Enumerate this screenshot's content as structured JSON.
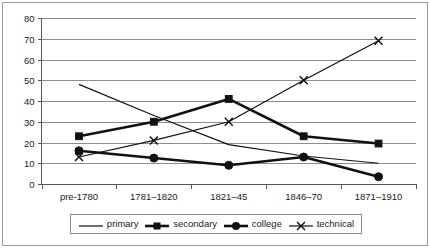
{
  "chart_data": {
    "type": "line",
    "title": "",
    "xlabel": "",
    "ylabel": "",
    "ylim": [
      0,
      80
    ],
    "ytick_step": 10,
    "yticks": [
      "0",
      "10",
      "20",
      "30",
      "40",
      "50",
      "60",
      "70",
      "80"
    ],
    "grid": true,
    "legend_position": "bottom",
    "categories": [
      "pre-1780",
      "1781–1820",
      "1821–45",
      "1846–70",
      "1871–1910"
    ],
    "series": [
      {
        "name": "primary",
        "marker": "none",
        "line": "thin",
        "values": [
          48,
          33,
          19,
          13.5,
          10
        ]
      },
      {
        "name": "secondary",
        "marker": "square",
        "line": "thick",
        "values": [
          23,
          30,
          41,
          23,
          19.5
        ]
      },
      {
        "name": "college",
        "marker": "circle",
        "line": "thick",
        "values": [
          16,
          12.5,
          9,
          13,
          3.5
        ]
      },
      {
        "name": "technical",
        "marker": "cross",
        "line": "thin",
        "values": [
          13,
          21,
          30,
          50,
          69
        ]
      }
    ]
  },
  "legend": {
    "items": [
      {
        "label": "primary",
        "icon": "line-swatch-icon"
      },
      {
        "label": "secondary",
        "icon": "line-square-swatch-icon"
      },
      {
        "label": "college",
        "icon": "line-circle-swatch-icon"
      },
      {
        "label": "technical",
        "icon": "line-cross-swatch-icon"
      }
    ]
  }
}
